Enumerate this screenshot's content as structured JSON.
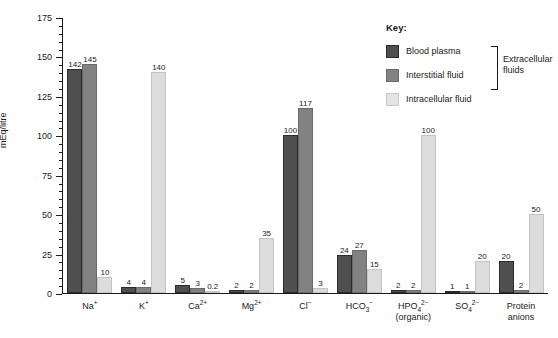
{
  "chart_data": {
    "type": "bar",
    "title": "",
    "xlabel": "",
    "ylabel": "mEq/litre",
    "ylim": [
      0,
      175
    ],
    "ytick_values": [
      0,
      25,
      50,
      75,
      100,
      125,
      150,
      175
    ],
    "ytick_labels": [
      "0",
      "25",
      "50",
      "75",
      "100",
      "125",
      "150",
      "175"
    ],
    "minor_tick_step": 5,
    "grid": false,
    "legend_position": "upper-right-inside",
    "categories": [
      "Na+",
      "K+",
      "Ca2+",
      "Mg2+",
      "Cl-",
      "HCO3-",
      "HPO4 2- (organic)",
      "SO4 2-",
      "Protein anions"
    ],
    "category_labels_html": [
      {
        "main": "Na",
        "sup": "+",
        "sub": "",
        "second_line": ""
      },
      {
        "main": "K",
        "sup": "+",
        "sub": "",
        "second_line": ""
      },
      {
        "main": "Ca",
        "sup": "2+",
        "sub": "",
        "second_line": ""
      },
      {
        "main": "Mg",
        "sup": "2+",
        "sub": "",
        "second_line": ""
      },
      {
        "main": "Cl",
        "sup": "−",
        "sub": "",
        "second_line": ""
      },
      {
        "main": "HCO",
        "sup": "−",
        "sub": "3",
        "second_line": ""
      },
      {
        "main": "HPO",
        "sup": "2−",
        "sub": "4",
        "second_line": "(organic)"
      },
      {
        "main": "SO",
        "sup": "2−",
        "sub": "4",
        "second_line": ""
      },
      {
        "main": "Protein",
        "sup": "",
        "sub": "",
        "second_line": "anions"
      }
    ],
    "series": [
      {
        "name": "Blood plasma",
        "color": "#4f4f4f",
        "values": [
          142,
          4,
          5,
          2,
          100,
          24,
          2,
          1,
          20
        ],
        "labels": [
          "142",
          "4",
          "5",
          "2",
          "100",
          "24",
          "2",
          "1",
          "20"
        ]
      },
      {
        "name": "Interstitial fluid",
        "color": "#828282",
        "values": [
          145,
          4,
          3,
          2,
          117,
          27,
          2,
          1,
          2
        ],
        "labels": [
          "145",
          "4",
          "3",
          "2",
          "117",
          "27",
          "2",
          "1",
          "2"
        ]
      },
      {
        "name": "Intracellular fluid",
        "color": "#dcdcdc",
        "values": [
          10,
          140,
          0.2,
          35,
          3,
          15,
          100,
          20,
          50
        ],
        "labels": [
          "10",
          "140",
          "0.2",
          "35",
          "3",
          "15",
          "100",
          "20",
          "50"
        ]
      }
    ]
  },
  "legend": {
    "title": "Key:",
    "items": [
      {
        "label": "Blood plasma",
        "swatch": "dark-gray-swatch"
      },
      {
        "label": "Interstitial fluid",
        "swatch": "medium-gray-swatch"
      },
      {
        "label": "Intracellular fluid",
        "swatch": "light-gray-swatch"
      }
    ],
    "bracket_label_line1": "Extracellular",
    "bracket_label_line2": "fluids"
  }
}
